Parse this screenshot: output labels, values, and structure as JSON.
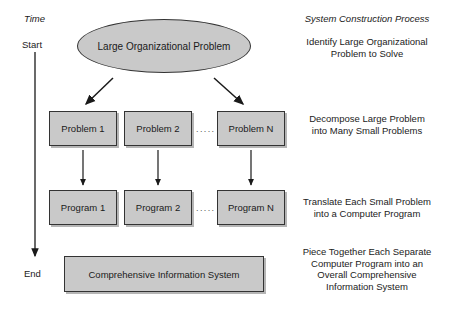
{
  "figure": {
    "background_color": "#ffffff",
    "shape_fill_color": "#c9c9c9",
    "shape_stroke_color": "#333333",
    "text_color": "#1a1a1a"
  },
  "time_axis": {
    "title": "Time",
    "start_label": "Start",
    "end_label": "End"
  },
  "process_column": {
    "title": "System Construction Process",
    "steps": [
      "Identify Large Organizational\nProblem to Solve",
      "Decompose Large Problem\ninto Many Small Problems",
      "Translate Each Small Problem\ninto a Computer Program",
      "Piece Together Each Separate\nComputer Program into an\nOverall Comprehensive\nInformation System"
    ]
  },
  "nodes": {
    "root": "Large Organizational Problem",
    "problems": [
      "Problem 1",
      "Problem 2",
      "Problem N"
    ],
    "programs": [
      "Program 1",
      "Program 2",
      "Program N"
    ],
    "result": "Comprehensive Information System",
    "ellipsis": "....."
  }
}
